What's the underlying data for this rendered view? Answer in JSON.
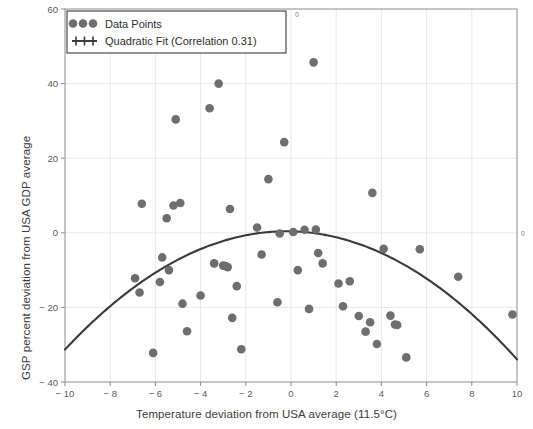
{
  "chart_data": {
    "type": "scatter",
    "title": "",
    "xlabel": "Temperature deviation from USA average (11.5°C)",
    "ylabel": "GSP percent deviation from USA GDP average",
    "xlim": [
      -10,
      10
    ],
    "ylim": [
      -40,
      60
    ],
    "xticks": [
      -10,
      -8,
      -6,
      -4,
      -2,
      0,
      2,
      4,
      6,
      8,
      10
    ],
    "xticklabels": [
      "− 10",
      "− 8",
      "− 6",
      "− 4",
      "− 2",
      "0",
      "2",
      "4",
      "6",
      "8",
      "10"
    ],
    "yticks": [
      -40,
      -20,
      0,
      20,
      40,
      60
    ],
    "yticklabels": [
      "− 40",
      "− 20",
      "0",
      "20",
      "40",
      "60"
    ],
    "secondary_top_tick_label": "0",
    "secondary_right_tick_label": "0",
    "grid": true,
    "grid_color": "#e8e8ec",
    "marker_color": "#6e6e6e",
    "line_color": "#3a3a3a",
    "legend_position": "upper left",
    "legend": [
      {
        "label": "Data Points",
        "marker": "circle",
        "color": "#6e6e6e"
      },
      {
        "label": "Quadratic Fit (Correlation 0.31)",
        "marker": "line",
        "color": "#3a3a3a"
      }
    ],
    "series": [
      {
        "name": "Data Points",
        "points": [
          [
            -6.6,
            7.8
          ],
          [
            -6.9,
            -12.2
          ],
          [
            -6.7,
            -16.0
          ],
          [
            -6.1,
            -32.2
          ],
          [
            -5.8,
            -13.2
          ],
          [
            -5.7,
            -6.6
          ],
          [
            -5.5,
            3.9
          ],
          [
            -5.4,
            -10.0
          ],
          [
            -5.2,
            7.3
          ],
          [
            -5.1,
            30.4
          ],
          [
            -4.9,
            8.0
          ],
          [
            -4.8,
            -19.0
          ],
          [
            -4.6,
            -26.4
          ],
          [
            -4.0,
            -16.8
          ],
          [
            -3.6,
            33.4
          ],
          [
            -3.4,
            -8.2
          ],
          [
            -3.2,
            40.0
          ],
          [
            -3.0,
            -8.8
          ],
          [
            -2.9,
            -8.9
          ],
          [
            -2.8,
            -9.2
          ],
          [
            -2.7,
            6.4
          ],
          [
            -2.6,
            -22.8
          ],
          [
            -2.4,
            -14.3
          ],
          [
            -2.2,
            -31.2
          ],
          [
            -1.5,
            1.4
          ],
          [
            -1.3,
            -5.8
          ],
          [
            -1.0,
            14.4
          ],
          [
            -0.6,
            -18.6
          ],
          [
            -0.5,
            -0.2
          ],
          [
            -0.3,
            24.3
          ],
          [
            0.1,
            0.2
          ],
          [
            0.3,
            -10.0
          ],
          [
            0.6,
            0.8
          ],
          [
            0.8,
            -20.4
          ],
          [
            1.0,
            45.7
          ],
          [
            1.1,
            0.9
          ],
          [
            1.2,
            -5.4
          ],
          [
            1.4,
            -8.2
          ],
          [
            2.1,
            -13.6
          ],
          [
            2.3,
            -19.7
          ],
          [
            2.6,
            -13.0
          ],
          [
            3.0,
            -22.3
          ],
          [
            3.3,
            -26.5
          ],
          [
            3.5,
            -24.0
          ],
          [
            3.6,
            10.7
          ],
          [
            3.8,
            -29.8
          ],
          [
            4.1,
            -4.3
          ],
          [
            4.4,
            -22.2
          ],
          [
            4.6,
            -24.6
          ],
          [
            4.7,
            -24.7
          ],
          [
            5.1,
            -33.4
          ],
          [
            5.7,
            -4.4
          ],
          [
            7.4,
            -11.8
          ],
          [
            9.8,
            -21.9
          ]
        ]
      }
    ],
    "fit": {
      "name": "Quadratic Fit (Correlation 0.31)",
      "correlation": 0.31,
      "vertex_x": -0.2,
      "vertex_y": 0.4,
      "curvature": -0.33,
      "endpoints": [
        [
          -10,
          -32.0
        ],
        [
          10,
          -33.8
        ]
      ]
    }
  }
}
